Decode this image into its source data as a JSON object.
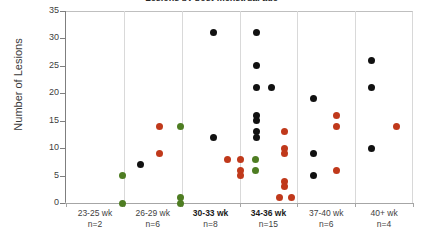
{
  "chart_data": {
    "type": "scatter",
    "title": "Lesions by post-menstrual age",
    "xlabel": "",
    "ylabel": "Number of Lesions",
    "ylim": [
      0,
      35
    ],
    "yticks": [
      0,
      5,
      10,
      15,
      20,
      25,
      30,
      35
    ],
    "ytick_labels": [
      "0",
      "5",
      "10",
      "15",
      "20",
      "25",
      "30",
      "35"
    ],
    "grid": false,
    "legend": "none",
    "categories": [
      "23-25 wk",
      "26-29 wk",
      "30-33 wk",
      "34-36 wk",
      "37-40 wk",
      "40+ wk"
    ],
    "category_counts": [
      "n=2",
      "n=6",
      "n=8",
      "n=15",
      "n=6",
      "n=4"
    ],
    "bold_categories": [
      "30-33 wk",
      "34-36 wk"
    ],
    "colors": {
      "black": "#111111",
      "red": "#c0391b",
      "green": "#4e7d22",
      "axis": "#7f7f7f",
      "separator": "#d9d9d9",
      "plot_border": "#bfbfbf"
    },
    "series": [
      {
        "name": "black",
        "color": "#111111",
        "points": [
          {
            "category": "26-29 wk",
            "offset": -0.22,
            "value": 7
          },
          {
            "category": "30-33 wk",
            "offset": 0.05,
            "value": 31
          },
          {
            "category": "30-33 wk",
            "offset": 0.05,
            "value": 12
          },
          {
            "category": "34-36 wk",
            "offset": -0.2,
            "value": 31
          },
          {
            "category": "34-36 wk",
            "offset": -0.2,
            "value": 25
          },
          {
            "category": "34-36 wk",
            "offset": -0.2,
            "value": 21
          },
          {
            "category": "34-36 wk",
            "offset": 0.06,
            "value": 21
          },
          {
            "category": "34-36 wk",
            "offset": -0.2,
            "value": 16
          },
          {
            "category": "34-36 wk",
            "offset": -0.2,
            "value": 15
          },
          {
            "category": "34-36 wk",
            "offset": -0.2,
            "value": 13
          },
          {
            "category": "34-36 wk",
            "offset": -0.2,
            "value": 12
          },
          {
            "category": "37-40 wk",
            "offset": -0.22,
            "value": 19
          },
          {
            "category": "37-40 wk",
            "offset": -0.22,
            "value": 9
          },
          {
            "category": "37-40 wk",
            "offset": -0.22,
            "value": 5
          },
          {
            "category": "40+ wk",
            "offset": -0.22,
            "value": 26
          },
          {
            "category": "40+ wk",
            "offset": -0.22,
            "value": 21
          },
          {
            "category": "40+ wk",
            "offset": -0.22,
            "value": 10
          }
        ]
      },
      {
        "name": "red",
        "color": "#c0391b",
        "points": [
          {
            "category": "26-29 wk",
            "offset": 0.12,
            "value": 14
          },
          {
            "category": "26-29 wk",
            "offset": 0.12,
            "value": 9
          },
          {
            "category": "30-33 wk",
            "offset": 0.3,
            "value": 8
          },
          {
            "category": "30-33 wk",
            "offset": 0.52,
            "value": 8
          },
          {
            "category": "30-33 wk",
            "offset": 0.52,
            "value": 6
          },
          {
            "category": "30-33 wk",
            "offset": 0.52,
            "value": 5
          },
          {
            "category": "34-36 wk",
            "offset": 0.28,
            "value": 13
          },
          {
            "category": "34-36 wk",
            "offset": 0.28,
            "value": 10
          },
          {
            "category": "34-36 wk",
            "offset": 0.28,
            "value": 9
          },
          {
            "category": "34-36 wk",
            "offset": 0.28,
            "value": 4
          },
          {
            "category": "34-36 wk",
            "offset": 0.28,
            "value": 3
          },
          {
            "category": "34-36 wk",
            "offset": 0.2,
            "value": 1
          },
          {
            "category": "34-36 wk",
            "offset": 0.4,
            "value": 1
          },
          {
            "category": "37-40 wk",
            "offset": 0.18,
            "value": 16
          },
          {
            "category": "37-40 wk",
            "offset": 0.18,
            "value": 14
          },
          {
            "category": "37-40 wk",
            "offset": 0.18,
            "value": 6
          },
          {
            "category": "40+ wk",
            "offset": 0.22,
            "value": 14
          }
        ]
      },
      {
        "name": "green",
        "color": "#4e7d22",
        "points": [
          {
            "category": "23-25 wk",
            "offset": 0.48,
            "value": 5
          },
          {
            "category": "23-25 wk",
            "offset": 0.48,
            "value": 0
          },
          {
            "category": "26-29 wk",
            "offset": 0.48,
            "value": 14
          },
          {
            "category": "26-29 wk",
            "offset": 0.48,
            "value": 1
          },
          {
            "category": "26-29 wk",
            "offset": 0.48,
            "value": 0
          },
          {
            "category": "30-33 wk",
            "offset": 0.78,
            "value": 8
          },
          {
            "category": "30-33 wk",
            "offset": 0.78,
            "value": 6
          }
        ]
      }
    ]
  }
}
